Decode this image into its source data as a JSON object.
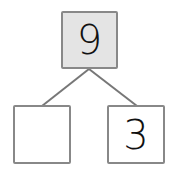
{
  "number_bond": {
    "whole": "9",
    "parts": [
      "",
      "3"
    ]
  },
  "colors": {
    "whole_fill": "#e4e4e4",
    "part_fill": "#ffffff",
    "border": "#888888",
    "line": "#777777",
    "text": "#111111"
  }
}
